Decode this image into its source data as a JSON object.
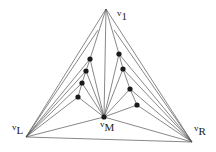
{
  "diagram": {
    "type": "graph",
    "vertices": {
      "v1": {
        "label_base": "v",
        "label_sub": "1"
      },
      "vL": {
        "label_base": "v",
        "label_sub": "L"
      },
      "vR": {
        "label_base": "v",
        "label_sub": "R"
      },
      "vM": {
        "label_base": "v",
        "label_sub": "M"
      }
    },
    "left_chain_count": 4,
    "right_chain_count": 4,
    "colors": {
      "edge": "#555555",
      "node": "#1a1a1a",
      "background": "#ffffff"
    }
  }
}
